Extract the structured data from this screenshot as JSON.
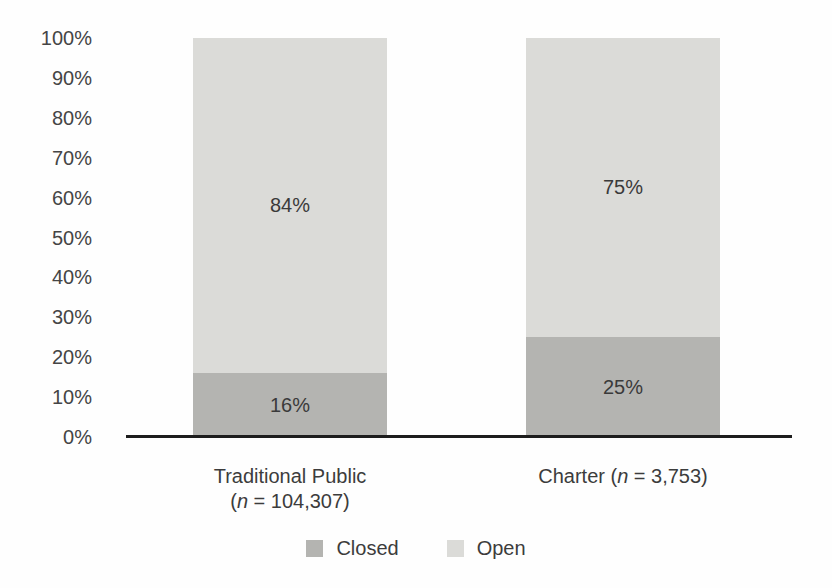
{
  "chart_data": {
    "type": "bar",
    "subtype": "stacked-percentage",
    "orientation": "vertical",
    "title": "",
    "xlabel": "",
    "ylabel": "",
    "categories": [
      "Traditional Public (n = 104,307)",
      "Charter (n = 3,753)"
    ],
    "series": [
      {
        "name": "Closed",
        "values": [
          16,
          25
        ],
        "labels": [
          "16%",
          "25%"
        ],
        "color": "#b4b4b1"
      },
      {
        "name": "Open",
        "values": [
          84,
          75
        ],
        "labels": [
          "84%",
          "75%"
        ],
        "color": "#dbdbd8"
      }
    ],
    "y_ticks_top_to_bottom": [
      "100%",
      "90%",
      "80%",
      "70%",
      "60%",
      "50%",
      "40%",
      "30%",
      "20%",
      "10%",
      "0%"
    ],
    "ylim": [
      0,
      100
    ],
    "grid": false,
    "legend_position": "bottom",
    "axis_line_color": "#1d1d1d",
    "text_color": "#3c3c3c"
  },
  "category_labels": [
    {
      "line1": "Traditional Public",
      "pre": "(",
      "n": "n",
      "post": " = 104,307)"
    },
    {
      "line1": "Charter ",
      "pre": "(",
      "n": "n",
      "post": " = 3,753)"
    }
  ],
  "legend": {
    "items": [
      {
        "label": "Closed"
      },
      {
        "label": "Open"
      }
    ]
  }
}
